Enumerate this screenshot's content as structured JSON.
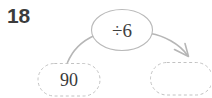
{
  "worksheet": {
    "question_number": "18",
    "type": "function-machine",
    "machine": {
      "operation_label": "÷6",
      "shape": "ellipse"
    },
    "input_node": {
      "label": "90",
      "shape": "dashed-rounded-bubble",
      "filled": true
    },
    "output_node": {
      "label": "",
      "shape": "dashed-rounded-bubble",
      "filled": false,
      "is_answer_blank": true
    },
    "arrows": {
      "input_to_machine": "curve-up-right-no-head",
      "machine_to_output": "curve-down-right-with-arrowhead"
    },
    "colors": {
      "background": "#ffffff",
      "number_text": "#3c3c3c",
      "node_text": "#3a3a3a",
      "bubble_stroke": "#c2c2c2",
      "ellipse_stroke": "#b9b9b9",
      "arrow_stroke": "#b6b6b6"
    }
  }
}
